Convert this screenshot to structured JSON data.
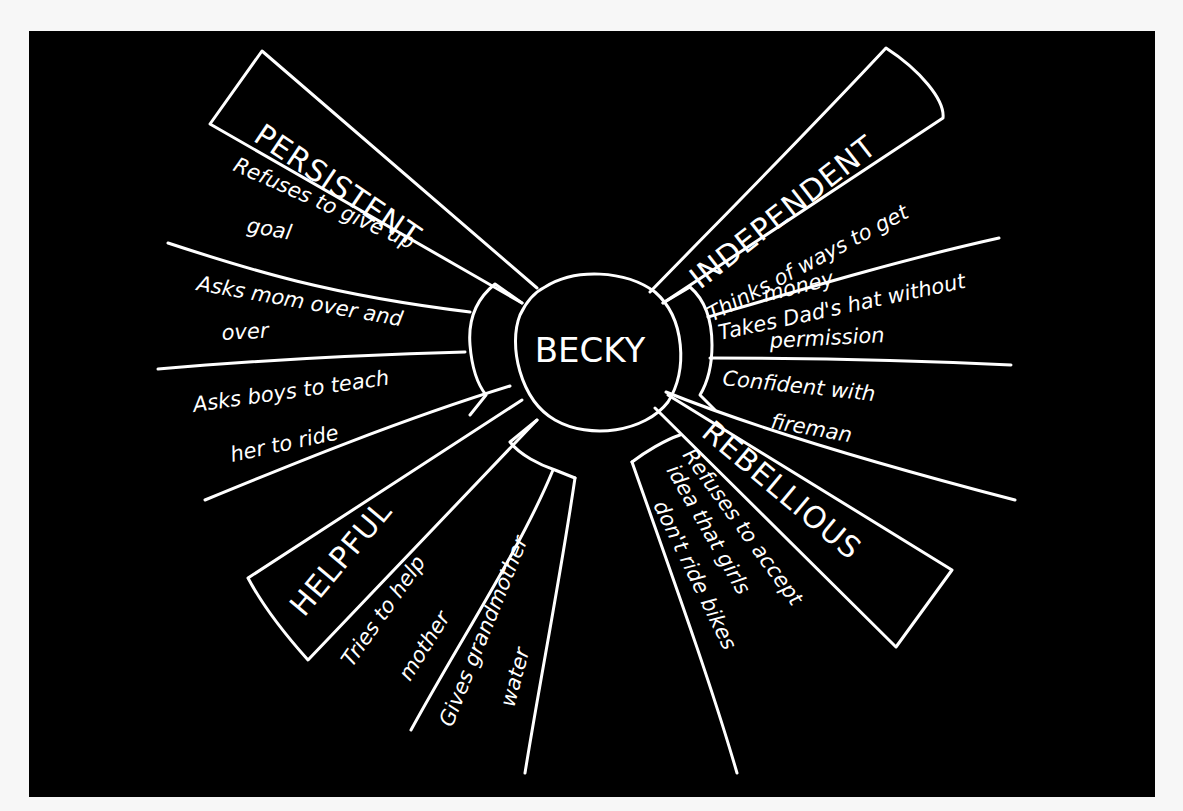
{
  "diagram": {
    "type": "character-web",
    "center": {
      "label": "BECKY"
    },
    "traits": [
      {
        "name": "PERSISTENT",
        "examples": [
          {
            "lines": [
              "Refuses to give up",
              "goal"
            ]
          },
          {
            "lines": [
              "Asks mom over and",
              "over"
            ]
          },
          {
            "lines": [
              "Asks boys to teach",
              "her to ride"
            ]
          }
        ]
      },
      {
        "name": "INDEPENDENT",
        "examples": [
          {
            "lines": [
              "Thinks of ways to get",
              "money"
            ]
          },
          {
            "lines": [
              "Takes Dad's hat without",
              "permission"
            ]
          },
          {
            "lines": [
              "Confident with",
              "fireman"
            ]
          }
        ]
      },
      {
        "name": "HELPFUL",
        "examples": [
          {
            "lines": [
              "Tries to help",
              "mother"
            ]
          },
          {
            "lines": [
              "Gives grandmother",
              "water"
            ]
          }
        ]
      },
      {
        "name": "REBELLIOUS",
        "examples": [
          {
            "lines": [
              "Refuses to accept",
              "idea that girls",
              "don't ride bikes"
            ]
          }
        ]
      }
    ],
    "colors": {
      "background": "#000000",
      "ink": "#ffffff",
      "page": "#f7f7f7"
    }
  }
}
